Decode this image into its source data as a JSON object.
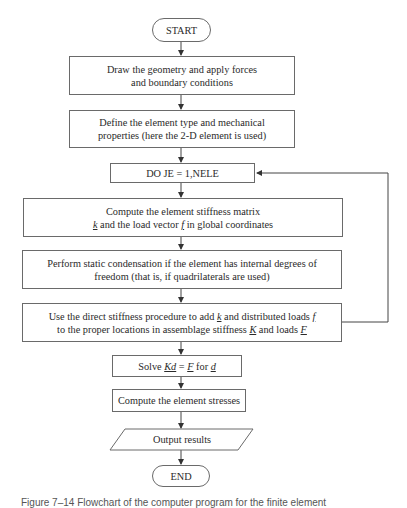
{
  "flowchart": {
    "start": "START",
    "step1": {
      "line1": "Draw the geometry and apply forces",
      "line2": "and boundary conditions"
    },
    "step2": {
      "line1": "Define the element type and mechanical",
      "line2": "properties (here the 2-D element is used)"
    },
    "loop": "DO JE = 1,NELE",
    "step3": {
      "line1": "Compute the element stiffness matrix",
      "line2_k": "k",
      "line2_a": " and the load vector ",
      "line2_f": "f",
      "line2_b": " in global coordinates"
    },
    "step4": {
      "line1": "Perform static condensation if the element has internal degrees of",
      "line2": "freedom (that is, if quadrilaterals are used)"
    },
    "step5": {
      "line1_a": "Use the direct stiffness procedure to add ",
      "line1_k": "k",
      "line1_b": " and distributed loads ",
      "line1_f": "f",
      "line2_a": "to the proper locations in assemblage stiffness ",
      "line2_K": "K",
      "line2_b": " and loads ",
      "line2_F": "F"
    },
    "step6": {
      "a": "Solve ",
      "Kd": "Kd",
      "b": " = ",
      "F": "F",
      "c": " for ",
      "d": "d"
    },
    "step7": "Compute the element stresses",
    "output": "Output results",
    "end": "END"
  },
  "caption": "Figure 7–14   Flowchart of the computer program for the finite element"
}
